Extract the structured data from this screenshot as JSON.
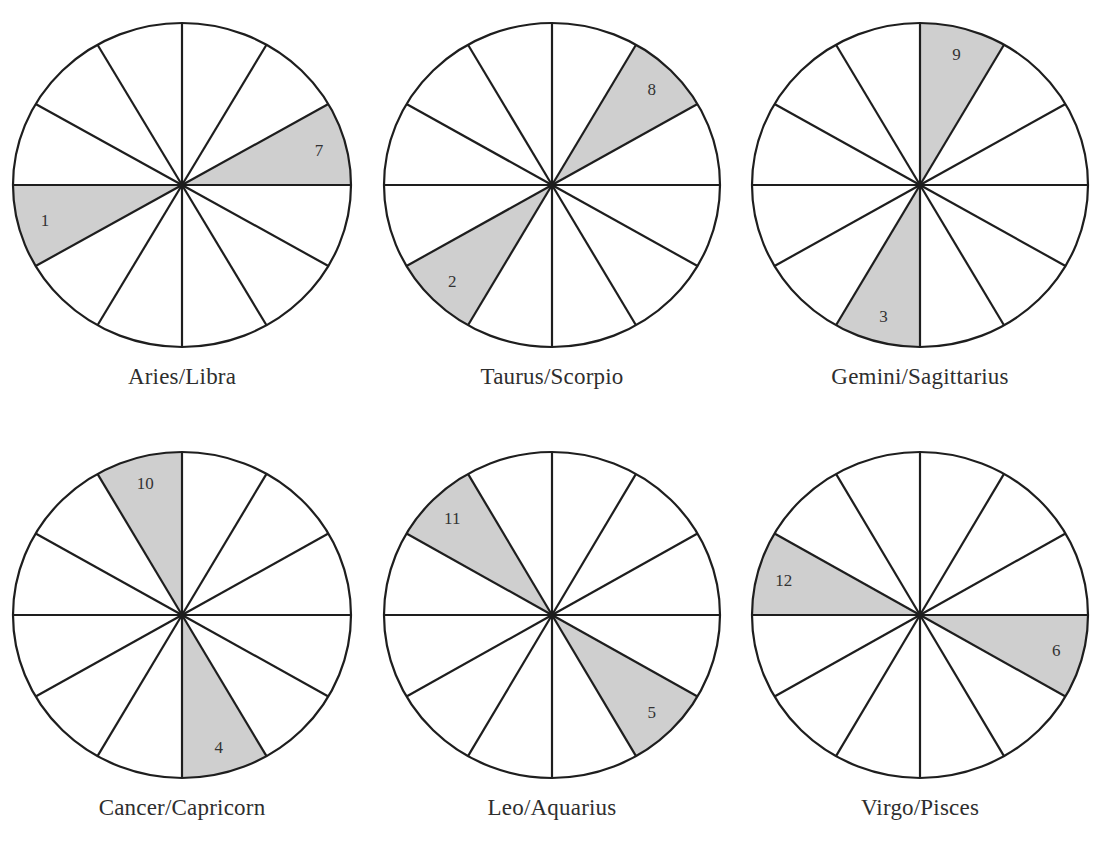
{
  "figure": {
    "colors": {
      "stroke": "#1e1e1e",
      "shaded": "#cfcfcf",
      "background": "#ffffff",
      "text": "#2e2e2e"
    },
    "wheels": [
      {
        "label": "Aries/Libra",
        "cx": 182,
        "cy": 185,
        "rx": 169,
        "ry": 162,
        "shaded_sectors": [
          {
            "house": "1",
            "start_deg": 150,
            "end_deg": 180
          },
          {
            "house": "7",
            "start_deg": 330,
            "end_deg": 360
          }
        ]
      },
      {
        "label": "Taurus/Scorpio",
        "cx": 552,
        "cy": 185,
        "rx": 168,
        "ry": 162,
        "shaded_sectors": [
          {
            "house": "2",
            "start_deg": 120,
            "end_deg": 150
          },
          {
            "house": "8",
            "start_deg": 300,
            "end_deg": 330
          }
        ]
      },
      {
        "label": "Gemini/Sagittarius",
        "cx": 920,
        "cy": 185,
        "rx": 168,
        "ry": 162,
        "shaded_sectors": [
          {
            "house": "3",
            "start_deg": 90,
            "end_deg": 120
          },
          {
            "house": "9",
            "start_deg": 270,
            "end_deg": 300
          }
        ]
      },
      {
        "label": "Cancer/Capricorn",
        "cx": 182,
        "cy": 615,
        "rx": 169,
        "ry": 163,
        "shaded_sectors": [
          {
            "house": "4",
            "start_deg": 60,
            "end_deg": 90
          },
          {
            "house": "10",
            "start_deg": 240,
            "end_deg": 270
          }
        ]
      },
      {
        "label": "Leo/Aquarius",
        "cx": 552,
        "cy": 615,
        "rx": 168,
        "ry": 163,
        "shaded_sectors": [
          {
            "house": "5",
            "start_deg": 30,
            "end_deg": 60
          },
          {
            "house": "11",
            "start_deg": 210,
            "end_deg": 240
          }
        ]
      },
      {
        "label": "Virgo/Pisces",
        "cx": 920,
        "cy": 615,
        "rx": 168,
        "ry": 163,
        "shaded_sectors": [
          {
            "house": "6",
            "start_deg": 0,
            "end_deg": 30
          },
          {
            "house": "12",
            "start_deg": 180,
            "end_deg": 210
          }
        ]
      }
    ],
    "sector_count": 12,
    "label_offsets_y": 202
  }
}
